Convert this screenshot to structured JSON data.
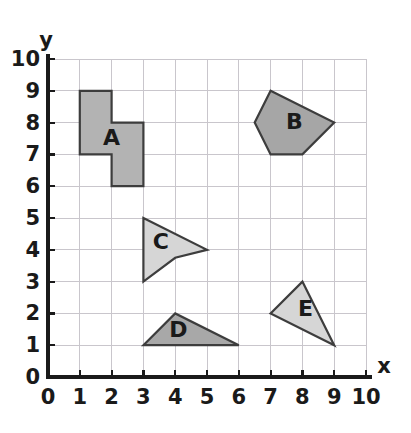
{
  "chart_data": {
    "type": "scatter",
    "title": "",
    "xlabel": "x",
    "ylabel": "y",
    "xlim": [
      0,
      10
    ],
    "ylim": [
      0,
      10
    ],
    "grid": true,
    "legend": "none",
    "x_ticks": [
      "0",
      "1",
      "2",
      "3",
      "4",
      "5",
      "6",
      "7",
      "8",
      "9",
      "10"
    ],
    "y_ticks": [
      "0",
      "1",
      "2",
      "3",
      "4",
      "5",
      "6",
      "7",
      "8",
      "9",
      "10"
    ],
    "x_tick_values": [
      0,
      1,
      2,
      3,
      4,
      5,
      6,
      7,
      8,
      9,
      10
    ],
    "y_tick_values": [
      0,
      1,
      2,
      3,
      4,
      5,
      6,
      7,
      8,
      9,
      10
    ],
    "shapes": [
      {
        "label": "A",
        "kind": "octagon-z-polygon",
        "fill": "#b3b3b3",
        "stroke": "#3d3d3d",
        "label_x": 2.0,
        "label_y": 7.5,
        "vertices": [
          [
            1,
            9
          ],
          [
            2,
            9
          ],
          [
            2,
            8
          ],
          [
            3,
            8
          ],
          [
            3,
            6
          ],
          [
            2,
            6
          ],
          [
            2,
            7
          ],
          [
            1,
            7
          ]
        ]
      },
      {
        "label": "B",
        "kind": "pentagon",
        "fill": "#a6a6a6",
        "stroke": "#3d3d3d",
        "label_x": 7.75,
        "label_y": 8.0,
        "vertices": [
          [
            7,
            9
          ],
          [
            9,
            8
          ],
          [
            8,
            7
          ],
          [
            7,
            7
          ],
          [
            6.5,
            8
          ]
        ]
      },
      {
        "label": "C",
        "kind": "concave-dart",
        "fill": "#d6d6d6",
        "stroke": "#3d3d3d",
        "label_x": 3.55,
        "label_y": 4.2,
        "vertices": [
          [
            3,
            5
          ],
          [
            5,
            4
          ],
          [
            4,
            3.75
          ],
          [
            3,
            3
          ]
        ]
      },
      {
        "label": "D",
        "kind": "triangle",
        "fill": "#a8a8a8",
        "stroke": "#3d3d3d",
        "label_x": 4.1,
        "label_y": 1.45,
        "vertices": [
          [
            3,
            1
          ],
          [
            4,
            2
          ],
          [
            6,
            1
          ]
        ]
      },
      {
        "label": "E",
        "kind": "triangle",
        "fill": "#d6d6d6",
        "stroke": "#3d3d3d",
        "label_x": 8.1,
        "label_y": 2.1,
        "vertices": [
          [
            8,
            3
          ],
          [
            9,
            1
          ],
          [
            7,
            2
          ]
        ]
      }
    ]
  },
  "colors": {
    "grid": "#c9c6cc",
    "axis": "#1a1a1a",
    "background": "#ffffff",
    "shape_dark": "#a6a6a6",
    "shape_light": "#d6d6d6",
    "shape_outline": "#3d3d3d"
  },
  "geometry": {
    "origin_x_px": 48,
    "origin_y_px": 377,
    "unit_px": 31.8
  }
}
